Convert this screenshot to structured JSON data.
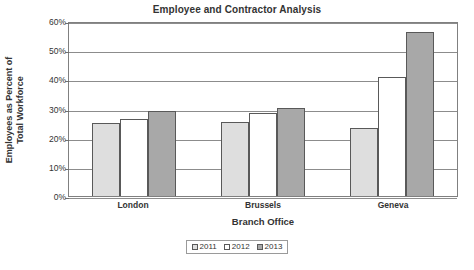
{
  "chart_data": {
    "type": "bar",
    "title": "Employee and Contractor Analysis",
    "xlabel": "Branch Office",
    "ylabel": "Employees as Percent of Total Workforce",
    "ylabel_line1": "Employees as Percent of",
    "ylabel_line2": "Total Workforce",
    "categories": [
      "London",
      "Brussels",
      "Geneva"
    ],
    "series": [
      {
        "name": "2011",
        "values": [
          25,
          25.5,
          23.3
        ],
        "color": "#dedede"
      },
      {
        "name": "2012",
        "values": [
          26.5,
          28.5,
          40.8
        ],
        "color": "#ffffff"
      },
      {
        "name": "2013",
        "values": [
          29,
          30.3,
          56.3
        ],
        "color": "#a8a8a8"
      }
    ],
    "ylim": [
      0,
      60
    ],
    "ytick_values": [
      60,
      50,
      40,
      30,
      20,
      10,
      0
    ],
    "ytick_labels": [
      "60%",
      "50%",
      "40%",
      "30%",
      "20%",
      "10%",
      "0%"
    ],
    "grid": true,
    "legend_position": "bottom"
  }
}
